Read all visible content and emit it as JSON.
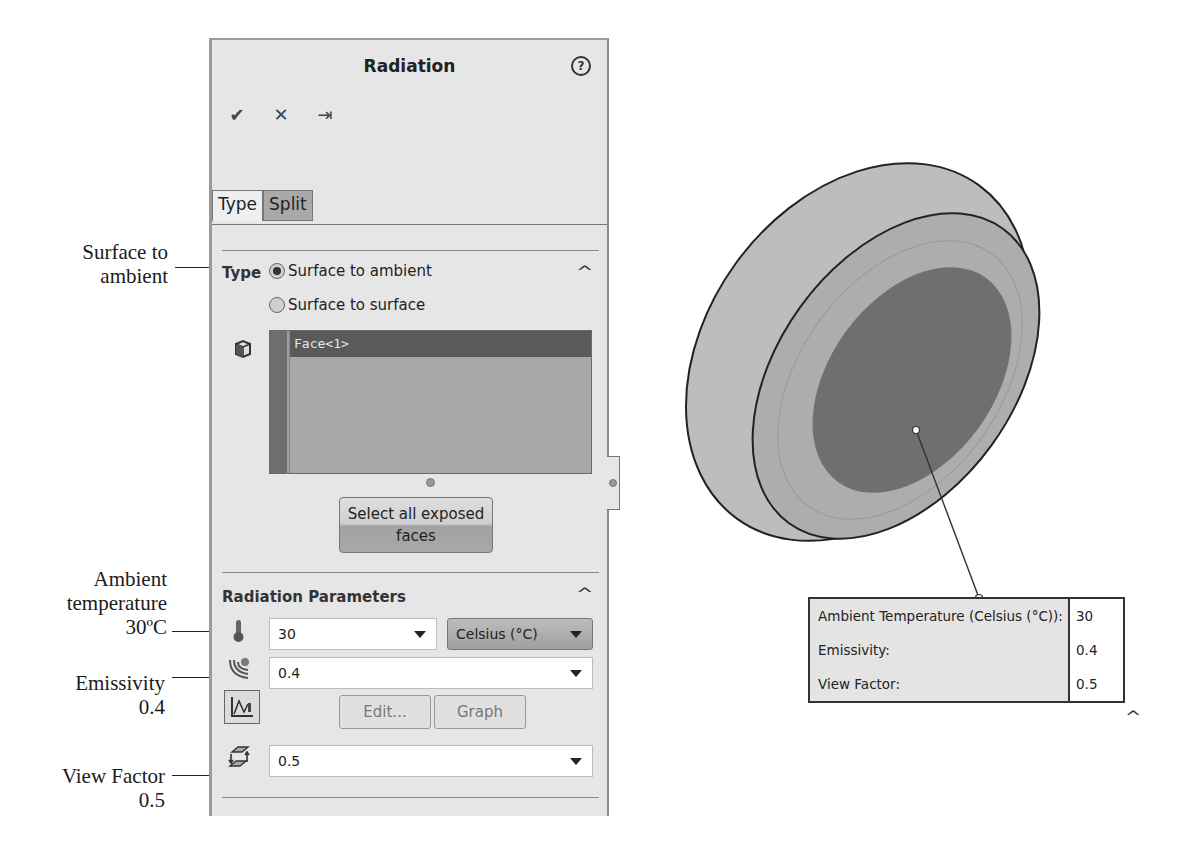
{
  "panel": {
    "title": "Radiation",
    "help_icon": "help-icon",
    "toolbar": {
      "ok": "✔",
      "cancel": "✕",
      "pin": "⇥"
    },
    "tabs": [
      {
        "label": "Type",
        "active": true
      },
      {
        "label": "Split",
        "active": false
      }
    ],
    "type_section": {
      "title": "Type",
      "radio_options": [
        {
          "label": "Surface to ambient",
          "selected": true
        },
        {
          "label": "Surface to surface",
          "selected": false
        }
      ],
      "selection_list": [
        "Face<1>"
      ],
      "select_all_button": "Select all exposed faces"
    },
    "radiation_parameters": {
      "title": "Radiation Parameters",
      "ambient_temperature": "30",
      "temperature_unit": "Celsius (°C)",
      "emissivity": "0.4",
      "edit_button": "Edit...",
      "graph_button": "Graph",
      "view_factor": "0.5"
    }
  },
  "callouts": {
    "surface_to_ambient": [
      "Surface to",
      "ambient"
    ],
    "ambient_temperature": [
      "Ambient",
      "temperature",
      "30ºC"
    ],
    "emissivity": [
      "Emissivity",
      "0.4"
    ],
    "view_factor": [
      "View Factor",
      "0.5"
    ]
  },
  "model_annotation": {
    "rows": [
      {
        "label": "Ambient Temperature (Celsius (°C)):",
        "value": "30"
      },
      {
        "label": "Emissivity:",
        "value": "0.4"
      },
      {
        "label": "View Factor:",
        "value": "0.5"
      }
    ],
    "collapse_icon": "^"
  },
  "colors": {
    "panel_bg": "#e6e6e6",
    "selection_item_bg": "#5a5a5a",
    "model_outer": "#b3b3b3",
    "model_inner": "#6e6e6e"
  }
}
